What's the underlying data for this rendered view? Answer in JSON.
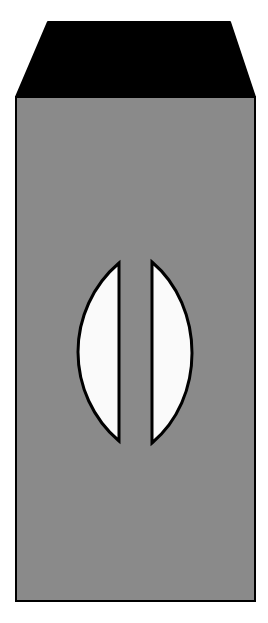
{
  "figure": {
    "background_color": "#ffffff",
    "outline_color": "#000000",
    "front_face": {
      "name": "front-face",
      "fill_color": "#8a8a8a",
      "stroke_color": "#000000",
      "stroke_width": 2,
      "points": "16,97 255,97 255,601 16,601"
    },
    "top_face": {
      "name": "top-face",
      "fill_color": "#000000",
      "stroke_color": "#000000",
      "stroke_width": 2,
      "points": "16,97 48,22 230,22 255,97"
    },
    "left_crescent": {
      "name": "left-crescent",
      "fill_color": "#fafafa",
      "stroke_color": "#000000",
      "stroke_width": 3,
      "tip_top": [
        119,
        263
      ],
      "tip_bottom": [
        119,
        441
      ],
      "bulge_x": 78,
      "path": "M 119 263 C 93 285, 78 318, 78 352 C 78 386, 93 419, 119 441 Z"
    },
    "right_crescent": {
      "name": "right-crescent",
      "fill_color": "#fafafa",
      "stroke_color": "#000000",
      "stroke_width": 3,
      "tip_top": [
        152,
        262
      ],
      "tip_bottom": [
        152,
        443
      ],
      "bulge_x": 191,
      "path": "M 152 262 C 178 284, 192 318, 192 353 C 192 388, 178 421, 152 443 Z"
    }
  }
}
